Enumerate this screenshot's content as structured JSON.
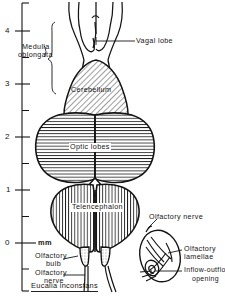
{
  "figure": {
    "kind": "scientific-anatomical-line-drawing",
    "species_caption": "Eucalia inconstans",
    "scale": {
      "unit_label": "mm",
      "tick_labels": [
        "4",
        "3",
        "2",
        "1",
        "0"
      ],
      "major_ticks": [
        4,
        3,
        2,
        1,
        0
      ],
      "minor_ticks": [
        4.5,
        3.5,
        2.5,
        1.5,
        0.5,
        -0.5
      ],
      "axis_top_value": 4.6,
      "axis_bottom_value": -1.0
    },
    "labels": {
      "vagal_lobe": "Vagal lobe",
      "medulla_oblongata_line1": "Medulla",
      "medulla_oblongata_line2": "oblongata",
      "cerebellum": "Cerebellum",
      "optic_lobes": "Optic lobes",
      "telencephalon": "Telencephalon",
      "olfactory_bulb_line1": "Olfactory",
      "olfactory_bulb_line2": "bulb",
      "olfactory_nerve_line1": "Olfactory",
      "olfactory_nerve_line2": "nerve",
      "inset_olfactory_nerve": "Olfactory nerve",
      "inset_olfactory_lamellae_line1": "Olfactory",
      "inset_olfactory_lamellae_line2": "lamellae",
      "inset_inflow_outflow_line1": "Inflow-outflow",
      "inset_inflow_outflow_line2": "opening"
    },
    "colors": {
      "ink": "#141414",
      "paper": "#ffffff",
      "hatch": "#1a1a1a",
      "fill_tint": "#f2f2f2"
    },
    "hatching": {
      "cerebellum": "diagonal",
      "optic_lobes": "horizontal",
      "telencephalon": "vertical",
      "olfactory_bulb": "dotted"
    }
  }
}
